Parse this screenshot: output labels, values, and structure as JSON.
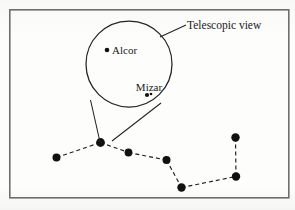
{
  "figure": {
    "frame": {
      "x": 9,
      "y": 9,
      "width": 279,
      "height": 188
    },
    "callout_label": "Telescopic view",
    "leader_line": {
      "x1": 160,
      "y1": 37,
      "x2": 186,
      "y2": 25
    },
    "label_position": {
      "x": 187,
      "y": 29
    },
    "telescopic_circle": {
      "cx": 129,
      "cy": 64,
      "r": 43
    },
    "cone_lines": [
      {
        "x1": 90.5,
        "y1": 100,
        "x2": 100,
        "y2": 142
      },
      {
        "x1": 161,
        "y1": 103,
        "x2": 112,
        "y2": 141
      }
    ],
    "magnified_stars": [
      {
        "name": "Alcor",
        "x": 107,
        "y": 50,
        "r": 2.3,
        "label_x": 112,
        "label_y": 54,
        "label_anchor": "start"
      },
      {
        "name": "Mizar",
        "x": 147,
        "y": 95,
        "r": 2.1,
        "label_x": 149,
        "label_y": 91,
        "label_anchor": "middle"
      }
    ],
    "mizar_companion": {
      "x": 151,
      "y": 94,
      "r": 1.3
    },
    "constellation_name": "Big Dipper",
    "constellation_stars": [
      {
        "id": "alkaid",
        "x": 56.5,
        "y": 157.5,
        "r": 4.0
      },
      {
        "id": "mizar",
        "x": 100.5,
        "y": 142.5,
        "r": 4.4
      },
      {
        "id": "alioth",
        "x": 128.5,
        "y": 152.5,
        "r": 3.9
      },
      {
        "id": "megrez",
        "x": 166.5,
        "y": 160.0,
        "r": 4.0
      },
      {
        "id": "phecda",
        "x": 181.5,
        "y": 187.5,
        "r": 4.2
      },
      {
        "id": "merak",
        "x": 236.0,
        "y": 176.5,
        "r": 4.2
      },
      {
        "id": "dubhe",
        "x": 235.5,
        "y": 137.5,
        "r": 4.2
      }
    ],
    "constellation_links": [
      [
        "alkaid",
        "mizar"
      ],
      [
        "mizar",
        "alioth"
      ],
      [
        "alioth",
        "megrez"
      ],
      [
        "megrez",
        "phecda"
      ],
      [
        "phecda",
        "merak"
      ],
      [
        "merak",
        "dubhe"
      ]
    ],
    "colors": {
      "ink": "#1a1a1a",
      "frame": "#6f6f70",
      "background": "#fdfdfc"
    }
  }
}
